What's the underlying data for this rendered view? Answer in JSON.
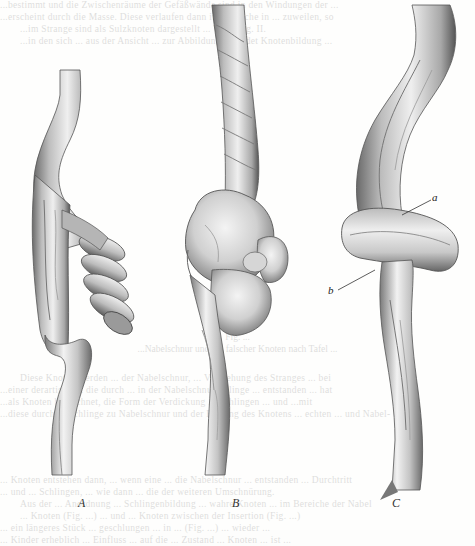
{
  "page": {
    "type": "scanned book page",
    "content": "anatomical illustrations of knotted umbilical cords"
  },
  "bleed_through_text": {
    "top_lines": [
      "...bestimmt und die Zwischenräume der Gefäßwände sind in den Windungen der ...",
      "...erscheint durch die Masse. Diese verlaufen dann im Bereiche in ... zuweilen, so",
      "...im Strange sind als Sulzknoten dargestellt ... W. in Fig. II.",
      "...in den sich ... aus der Ansicht ... zur Abbildung ... findet Knotenbildung ..."
    ],
    "figure_caption_lines": [
      "Fig. ...",
      "...Nabelschnur und ein falscher Knoten nach Tafel ..."
    ],
    "middle_lines": [
      "Diese Knoten werden ... der Nabelschnur, ... Verdrehung des Stranges ... bei",
      "...einer derartigen ... die durch ... in der Nabelschnurschlinge ... entstanden ... hat",
      "...als Knoten bezeichnet, die Form der Verdickung ... Schlingen ... und ...mit",
      "...diese durch ... Schlinge zu Nabelschnur und der Bildung des Knotens ... echten ... und Nabel-"
    ],
    "bottom_lines": [
      "... Knoten entstehen dann, ... wenn eine ... die Nabelschnur ... entstanden ... Durchtritt",
      "... und ... Schlingen, ... wie dann ... die der weiteren Umschnürung.",
      "Aus der ... Anordnung ... Schlingenbildung ... wahre Knoten ... im Bereiche der Nabel",
      "... Knoten (Fig. ...) ... und ... Knoten zwischen der Insertion (Fig. ...)",
      "... ein längeres Stück ... geschlungen ... in ... (Fig. ...) ... wieder ...",
      "... Kinder erheblich ... Einfluss ... auf die ... Zustand ... Knoten ... ist ..."
    ]
  },
  "figures": [
    {
      "id": "A",
      "label": "A",
      "description": "umbilical cord with spiral coils (false knot)"
    },
    {
      "id": "B",
      "label": "B",
      "description": "umbilical cord with bulbous varicose knot"
    },
    {
      "id": "C",
      "label": "C",
      "description": "umbilical cord with true knot",
      "annotations": [
        {
          "label": "a",
          "target": "upper crossing of loop"
        },
        {
          "label": "b",
          "target": "lower crossing under loop"
        }
      ]
    }
  ],
  "colors": {
    "paper": "#fefefd",
    "ink_dark": "#3a3a3a",
    "ink_mid": "#8a8a8a",
    "ink_light": "#d8d8d8"
  }
}
